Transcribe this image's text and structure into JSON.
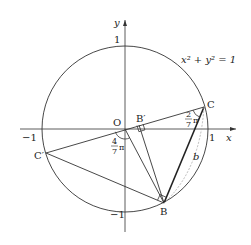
{
  "top_text": "",
  "diagram": {
    "equation": "x² + y² = 1",
    "axes": {
      "x_label": "x",
      "y_label": "y",
      "ticks": {
        "x_pos": "1",
        "x_neg": "−1",
        "y_pos": "1",
        "y_neg": "−1"
      }
    },
    "points": {
      "origin": "O",
      "C": "C",
      "C_prime": "C′",
      "B": "B",
      "B_prime": "B′"
    },
    "angles": {
      "at_C": {
        "num": "2",
        "den": "7",
        "sym": "π"
      },
      "at_O": {
        "num": "4",
        "den": "7",
        "sym": "π"
      }
    },
    "arc_label": "b"
  }
}
